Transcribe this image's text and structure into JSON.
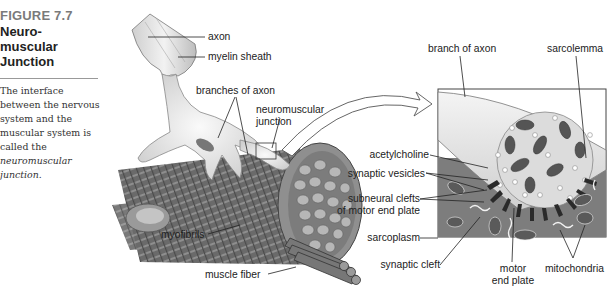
{
  "figure": {
    "number": "FIGURE 7.7",
    "title_lines": [
      "Neuro-",
      "muscular",
      "Junction"
    ],
    "description_prefix": "The interface between the nervous system and the muscular system is called the ",
    "description_term": "neuromuscular junction",
    "description_suffix": "."
  },
  "left_diagram": {
    "labels": {
      "axon": "axon",
      "myelin_sheath": "myelin sheath",
      "branches_of_axon": "branches of axon",
      "neuromuscular_junction_1": "neuromuscular",
      "neuromuscular_junction_2": "junction",
      "myofibrils": "myofibrils",
      "muscle_fiber": "muscle fiber"
    }
  },
  "inset_diagram": {
    "labels": {
      "branch_of_axon": "branch of axon",
      "sarcolemma": "sarcolemma",
      "acetylcholine": "acetylcholine",
      "synaptic_vesicles": "synaptic vesicles",
      "subneural_clefts_1": "subneural clefts",
      "subneural_clefts_2": "of motor end plate",
      "sarcoplasm": "sarcoplasm",
      "synaptic_cleft": "synaptic cleft",
      "motor_end_plate_1": "motor",
      "motor_end_plate_2": "end plate",
      "mitochondria": "mitochondria"
    }
  },
  "colors": {
    "figure_number": "#7a7a7a",
    "muscle_dark": "#5a5a5a",
    "muscle_mid": "#8a8a8a",
    "nerve_light": "#e4e4e4",
    "label_text": "#222222"
  }
}
